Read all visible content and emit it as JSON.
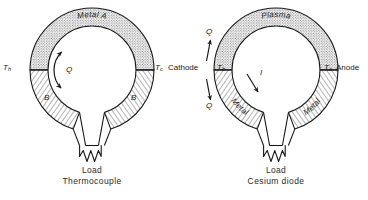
{
  "figures": [
    {
      "id": "thermocouple",
      "caption": "Thermocouple",
      "upper_arc_label": "Metal A",
      "lower_left_arc_label": "B",
      "lower_right_arc_label": "B",
      "hot_junction_label": "T",
      "hot_junction_sub": "h",
      "cold_junction_label": "T",
      "cold_junction_sub": "c",
      "heat_flow_label": "Q",
      "load_label": "Load"
    },
    {
      "id": "cesium-diode",
      "caption": "Cesium diode",
      "upper_arc_label": "Plasma",
      "lower_left_arc_label": "Metal",
      "lower_right_arc_label": "Metal",
      "cathode_label": "Cathode",
      "anode_label": "Anode",
      "hot_junction_label": "T",
      "hot_junction_sub": "h",
      "cold_junction_label": "T",
      "cold_junction_sub": "c",
      "heat_in_label": "Q",
      "heat_out_label": "Q",
      "current_label": "I",
      "load_label": "Load"
    }
  ],
  "colors": {
    "ink": "#1a1a1a",
    "hatch": "#3a3a3a",
    "background": "#ffffff"
  }
}
